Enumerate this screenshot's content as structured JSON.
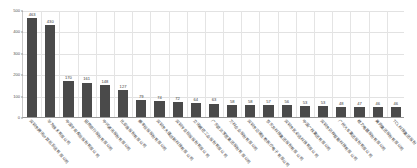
{
  "chart_data": {
    "type": "bar",
    "title": "",
    "subtitle": "",
    "xlabel": "",
    "ylabel": "",
    "ylim": [
      0,
      500
    ],
    "yticks": [
      0,
      100,
      200,
      300,
      400,
      500
    ],
    "ytick_labels": [
      "0",
      "100",
      "200",
      "300",
      "400",
      "500"
    ],
    "grid": true,
    "legend": false,
    "legend_position": "none",
    "orientation": "vertical",
    "sorted": "descending",
    "bar_color": "#4a4a4a",
    "data_labels": true,
    "categories": [
      "深圳市腾讯计算机系统有限公司",
      "华为技术有限公司",
      "中国平安保险股份有限公司",
      "招商银行股份有限公司",
      "中兴通讯股份有限公司",
      "比亚迪股份有限公司",
      "顺丰控股股份有限公司",
      "深圳市大疆创新科技有限公司",
      "深圳传音控股股份有限公司",
      "立讯精密工业股份有限公司",
      "广东欧派家居集团股份有限公司",
      "万科企业股份有限公司",
      "深圳市迈瑞生物医疗电子有限公司",
      "京东方科技集团股份有限公司",
      "深圳市优必选科技有限公司",
      "中国广核集团有限公司",
      "深圳市研祥智能科技有限公司",
      "广州汽车集团股份有限公司",
      "格力电器股份有限公司",
      "美的集团股份有限公司",
      "TCL科技集团股份"
    ],
    "values": [
      463,
      430,
      170,
      161,
      148,
      127,
      79,
      74,
      72,
      64,
      63,
      58,
      58,
      57,
      56,
      53,
      53,
      48,
      47,
      46,
      46
    ],
    "value_labels": [
      "463",
      "430",
      "170",
      "161",
      "148",
      "127",
      "79",
      "74",
      "72",
      "64",
      "63",
      "58",
      "58",
      "57",
      "56",
      "53",
      "53",
      "48",
      "47",
      "46",
      "46"
    ]
  }
}
